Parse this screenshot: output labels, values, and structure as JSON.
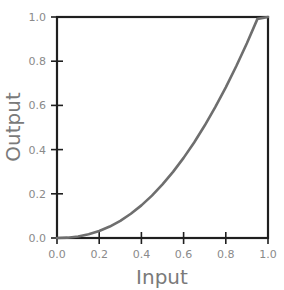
{
  "chart_data": {
    "type": "line",
    "title": "",
    "xlabel": "Input",
    "ylabel": "Output",
    "xlim": [
      0.0,
      1.0
    ],
    "ylim": [
      0.0,
      1.0
    ],
    "grid": false,
    "legend": false,
    "xticks": [
      "0.0",
      "0.2",
      "0.4",
      "0.6",
      "0.8",
      "1.0"
    ],
    "yticks": [
      "0.0",
      "0.2",
      "0.4",
      "0.6",
      "0.8",
      "1.0"
    ],
    "xtick_values": [
      0.0,
      0.2,
      0.4,
      0.6,
      0.8,
      1.0
    ],
    "ytick_values": [
      0.0,
      0.2,
      0.4,
      0.6,
      0.8,
      1.0
    ],
    "series": [
      {
        "name": "gamma-curve",
        "color": "#6e6e6e",
        "x": [
          0.0,
          0.05,
          0.1,
          0.15,
          0.2,
          0.25,
          0.3,
          0.35,
          0.4,
          0.45,
          0.5,
          0.55,
          0.6,
          0.65,
          0.7,
          0.75,
          0.8,
          0.85,
          0.9,
          0.95,
          1.0
        ],
        "y": [
          0.0,
          0.0015,
          0.0069,
          0.0166,
          0.0315,
          0.0518,
          0.0778,
          0.1097,
          0.1477,
          0.1919,
          0.2423,
          0.2992,
          0.3625,
          0.4324,
          0.5088,
          0.5919,
          0.6817,
          0.7782,
          0.8815,
          0.9915,
          1.0
        ]
      }
    ]
  },
  "style": {
    "background": "#ffffff",
    "frame_color": "#1f1f1f",
    "tick_label_color": "#8a8a8a",
    "axis_title_color": "#7a7a7a",
    "curve_color": "#6e6e6e"
  },
  "xtick_px": [
    57,
    99.2,
    141.4,
    183.6,
    225.8,
    268
  ],
  "ytick_px": [
    238,
    193.8,
    149.6,
    105.4,
    61.2,
    17
  ]
}
